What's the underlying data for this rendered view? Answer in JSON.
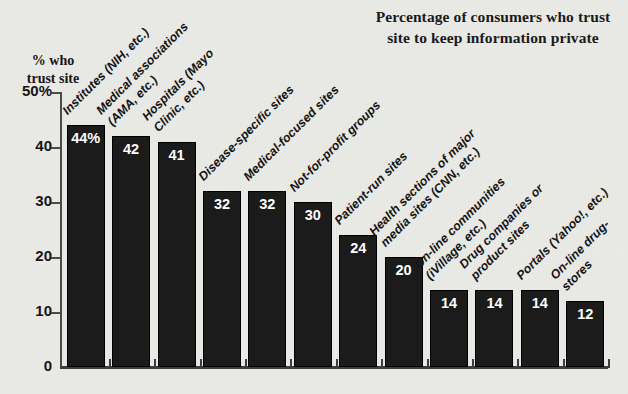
{
  "chart_data": {
    "type": "bar",
    "title": "Percentage of consumers who trust site to keep information private",
    "title_lines": [
      "Percentage of consumers who trust",
      "site to keep information private"
    ],
    "ylabel": "% who trust site",
    "ylabel_lines": [
      "% who",
      "trust site"
    ],
    "xlabel": "",
    "ylim": [
      0,
      50
    ],
    "grid": false,
    "legend": null,
    "ytick_labels": [
      "50%",
      "40",
      "30",
      "20",
      "10",
      "0"
    ],
    "ytick_values": [
      50,
      40,
      30,
      20,
      10,
      0
    ],
    "categories": [
      "Institutes (NIH, etc.)",
      "Medical associations (AMA, etc.)",
      "Hospitals (Mayo Clinic, etc.)",
      "Disease-specific sites",
      "Medical-focused sites",
      "Not-for-profit groups",
      "Patient-run sites",
      "Health sections of major media sites (CNN, etc.)",
      "On-line communities (iVillage, etc.)",
      "Drug companies or product sites",
      "Portals (Yahoo!, etc.)",
      "On-line drug-stores"
    ],
    "category_lines": [
      [
        "Institutes (NIH, etc.)"
      ],
      [
        "Medical associations",
        "(AMA, etc.)"
      ],
      [
        "Hospitals (Mayo",
        "Clinic, etc.)"
      ],
      [
        "Disease-specific sites"
      ],
      [
        "Medical-focused sites"
      ],
      [
        "Not-for-profit groups"
      ],
      [
        "Patient-run sites"
      ],
      [
        "Health sections of major",
        "media sites (CNN, etc.)"
      ],
      [
        "On-line communities",
        "(iVillage, etc.)"
      ],
      [
        "Drug companies or",
        "product sites"
      ],
      [
        "Portals (Yahoo!, etc.)"
      ],
      [
        "On-line drug-",
        "stores"
      ]
    ],
    "values": [
      44,
      42,
      41,
      32,
      32,
      30,
      24,
      20,
      14,
      14,
      14,
      12
    ],
    "value_labels": [
      "44%",
      "42",
      "41",
      "32",
      "32",
      "30",
      "24",
      "20",
      "14",
      "14",
      "14",
      "12"
    ]
  },
  "colors": {
    "background": "#e9e9e6",
    "bar": "#1b1b1b",
    "axis": "#3d3d3d",
    "text": "#141414",
    "value_text": "#fefefe"
  }
}
